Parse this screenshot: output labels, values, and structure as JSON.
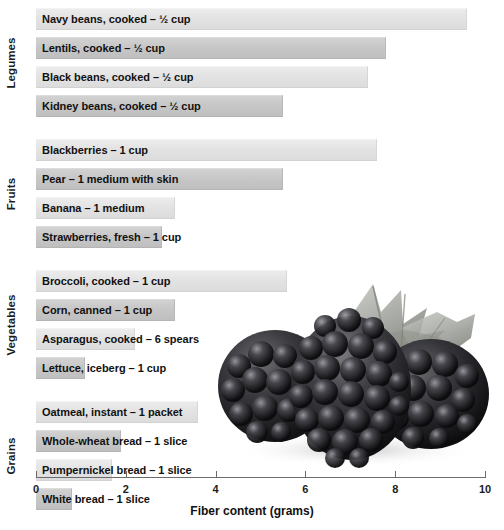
{
  "chart_data": {
    "type": "bar",
    "orientation": "horizontal",
    "title": "",
    "xlabel": "Fiber content (grams)",
    "ylabel": "",
    "xlim": [
      0,
      10
    ],
    "xticks": [
      0,
      2,
      4,
      6,
      8,
      10
    ],
    "xtick_labels": [
      "0",
      "2",
      "4",
      "6",
      "8",
      "10"
    ],
    "grid": false,
    "legend": "none",
    "group_labels": [
      "Legumes",
      "Fruits",
      "Vegetables",
      "Grains"
    ],
    "categories": [
      "Navy beans, cooked – ½ cup",
      "Lentils, cooked – ½ cup",
      "Black beans, cooked – ½ cup",
      "Kidney beans, cooked – ½ cup",
      "Blackberries – 1 cup",
      "Pear – 1 medium with skin",
      "Banana – 1 medium",
      "Strawberries, fresh – 1 cup",
      "Broccoli, cooked – 1 cup",
      "Corn, canned – 1 cup",
      "Asparagus, cooked – 6 spears",
      "Lettuce, iceberg – 1 cup",
      "Oatmeal, instant – 1 packet",
      "Whole-wheat bread – 1 slice",
      "Pumpernickel bread – 1 slice",
      "White bread – 1 slice"
    ],
    "values": [
      9.6,
      7.8,
      7.4,
      5.5,
      7.6,
      5.5,
      3.1,
      2.8,
      5.6,
      3.1,
      2.2,
      1.1,
      3.6,
      1.9,
      1.7,
      0.8
    ],
    "groups": [
      {
        "label": "Legumes",
        "items": [
          {
            "label": "Navy beans, cooked – ½ cup",
            "value": 9.6,
            "tone": "tone-a"
          },
          {
            "label": "Lentils, cooked – ½ cup",
            "value": 7.8,
            "tone": "tone-b"
          },
          {
            "label": "Black beans, cooked – ½ cup",
            "value": 7.4,
            "tone": "tone-a"
          },
          {
            "label": "Kidney beans, cooked – ½ cup",
            "value": 5.5,
            "tone": "tone-b"
          }
        ]
      },
      {
        "label": "Fruits",
        "items": [
          {
            "label": "Blackberries – 1 cup",
            "value": 7.6,
            "tone": "tone-a"
          },
          {
            "label": "Pear – 1 medium with skin",
            "value": 5.5,
            "tone": "tone-b"
          },
          {
            "label": "Banana – 1 medium",
            "value": 3.1,
            "tone": "tone-a"
          },
          {
            "label": "Strawberries, fresh – 1 cup",
            "value": 2.8,
            "tone": "tone-b"
          }
        ]
      },
      {
        "label": "Vegetables",
        "items": [
          {
            "label": "Broccoli, cooked – 1 cup",
            "value": 5.6,
            "tone": "tone-a"
          },
          {
            "label": "Corn, canned – 1 cup",
            "value": 3.1,
            "tone": "tone-b"
          },
          {
            "label": "Asparagus, cooked – 6 spears",
            "value": 2.2,
            "tone": "tone-a"
          },
          {
            "label": "Lettuce, iceberg – 1 cup",
            "value": 1.1,
            "tone": "tone-b"
          }
        ]
      },
      {
        "label": "Grains",
        "items": [
          {
            "label": "Oatmeal, instant – 1 packet",
            "value": 3.6,
            "tone": "tone-a"
          },
          {
            "label": "Whole-wheat bread – 1 slice",
            "value": 1.9,
            "tone": "tone-b"
          },
          {
            "label": "Pumpernickel bread – 1 slice",
            "value": 1.7,
            "tone": "tone-a"
          },
          {
            "label": "White bread – 1 slice",
            "value": 0.8,
            "tone": "tone-b"
          }
        ]
      }
    ],
    "colors": {
      "bar_light": "#e3e3e3",
      "bar_medium": "#c7c7c7",
      "axis": "#6b6b6b",
      "text": "#111111",
      "background": "#ffffff"
    },
    "decoration": "blackberries-photograph"
  },
  "layout": {
    "axis_x0_px": 36,
    "axis_x10_px": 485,
    "first_bar_top_px": 8,
    "bar_height_px": 22,
    "bar_gap_px": 7,
    "group_gap_px": 15
  }
}
